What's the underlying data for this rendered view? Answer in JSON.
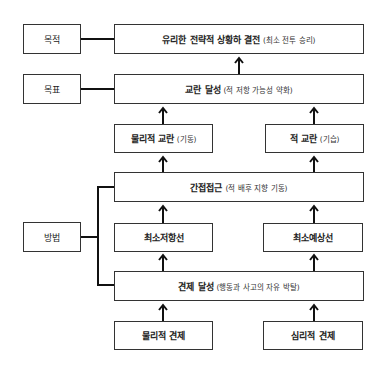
{
  "labels": {
    "purpose": "목적",
    "goal": "목표",
    "method": "방법"
  },
  "boxes": {
    "decisive_battle": {
      "main": "유리한 전략적 상황하 결전",
      "sub": "(최소 전투 승리)"
    },
    "dislocation": {
      "main": "교란 달성",
      "sub": "(적 저항 가능성 약화)"
    },
    "physical_dislocation": {
      "main": "물리적 교란",
      "sub": "(기동)"
    },
    "enemy_dislocation": {
      "main": "적 교란",
      "sub": "(기습)"
    },
    "indirect_approach": {
      "main": "간접접근",
      "sub": "(적 배후 지향 기동)"
    },
    "least_resistance": {
      "main": "최소저항선",
      "sub": ""
    },
    "least_expectation": {
      "main": "최소예상선",
      "sub": ""
    },
    "distraction": {
      "main": "견제 달성",
      "sub": "(행동과 사고의 자유 박탈)"
    },
    "physical_distraction": {
      "main": "물리적 견제",
      "sub": ""
    },
    "psychological_distraction": {
      "main": "심리적 견제",
      "sub": ""
    }
  },
  "colors": {
    "line": "#111111",
    "border": "#333333",
    "background": "#ffffff"
  }
}
